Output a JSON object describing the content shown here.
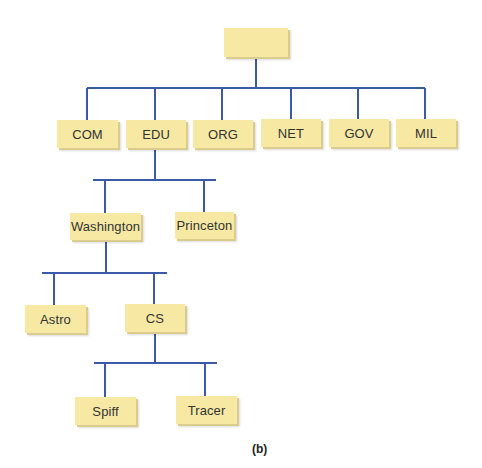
{
  "diagram": {
    "type": "tree",
    "line_color": "#3a5aa8",
    "node_fill": "#f7e9a4",
    "root": {
      "label": ""
    },
    "level1": [
      {
        "id": "com",
        "label": "COM"
      },
      {
        "id": "edu",
        "label": "EDU"
      },
      {
        "id": "org",
        "label": "ORG"
      },
      {
        "id": "net",
        "label": "NET"
      },
      {
        "id": "gov",
        "label": "GOV"
      },
      {
        "id": "mil",
        "label": "MIL"
      }
    ],
    "edu_children": [
      {
        "id": "washington",
        "label": "Washington"
      },
      {
        "id": "princeton",
        "label": "Princeton"
      }
    ],
    "washington_children": [
      {
        "id": "astro",
        "label": "Astro"
      },
      {
        "id": "cs",
        "label": "CS"
      }
    ],
    "cs_children": [
      {
        "id": "spiff",
        "label": "Spiff"
      },
      {
        "id": "tracer",
        "label": "Tracer"
      }
    ],
    "edges": [
      [
        "root",
        "COM"
      ],
      [
        "root",
        "EDU"
      ],
      [
        "root",
        "ORG"
      ],
      [
        "root",
        "NET"
      ],
      [
        "root",
        "GOV"
      ],
      [
        "root",
        "MIL"
      ],
      [
        "EDU",
        "Washington"
      ],
      [
        "EDU",
        "Princeton"
      ],
      [
        "Washington",
        "Astro"
      ],
      [
        "Washington",
        "CS"
      ],
      [
        "CS",
        "Spiff"
      ],
      [
        "CS",
        "Tracer"
      ]
    ]
  },
  "caption": "(b)"
}
